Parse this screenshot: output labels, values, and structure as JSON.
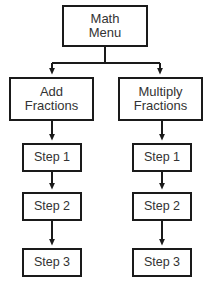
{
  "diagram": {
    "background_color": "#ffffff",
    "line_color": "#1a1a1a",
    "text_color": "#333333",
    "root": {
      "label": "Math\nMenu",
      "name": "node-math-menu"
    },
    "branches": [
      {
        "name": "node-add-fractions",
        "label": "Add\nFractions",
        "steps": [
          {
            "name": "node-add-step-1",
            "label": "Step 1"
          },
          {
            "name": "node-add-step-2",
            "label": "Step 2"
          },
          {
            "name": "node-add-step-3",
            "label": "Step 3"
          }
        ]
      },
      {
        "name": "node-multiply-fractions",
        "label": "Multiply\nFractions",
        "steps": [
          {
            "name": "node-multiply-step-1",
            "label": "Step 1"
          },
          {
            "name": "node-multiply-step-2",
            "label": "Step 2"
          },
          {
            "name": "node-multiply-step-3",
            "label": "Step 3"
          }
        ]
      }
    ]
  }
}
